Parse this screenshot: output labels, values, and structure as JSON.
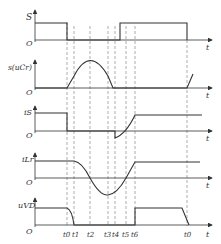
{
  "diagram": {
    "type": "timing-waveforms",
    "time_axis_label": "t",
    "origin_label": "O",
    "time_markers": [
      "t0",
      "t1",
      "t2",
      "t3",
      "t4",
      "t5",
      "t6",
      "t0"
    ],
    "panels": [
      {
        "id": "S",
        "label": "S",
        "description": "switch drive signal"
      },
      {
        "id": "uCr",
        "label": "s(uCr)",
        "description": "resonant capacitor voltage"
      },
      {
        "id": "iS",
        "label": "iS",
        "description": "switch current"
      },
      {
        "id": "iLr",
        "label": "iLr",
        "description": "resonant inductor current"
      },
      {
        "id": "uVD",
        "label": "uVD",
        "description": "diode voltage"
      }
    ]
  }
}
